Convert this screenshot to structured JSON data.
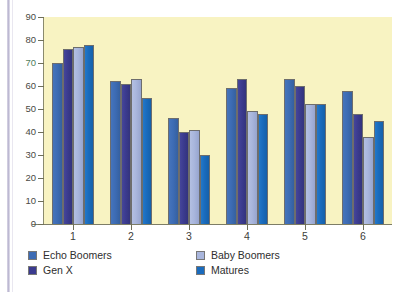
{
  "chart_data": {
    "type": "bar",
    "title": "",
    "subtitle": "",
    "xlabel": "",
    "ylabel": "",
    "categories": [
      "1",
      "2",
      "3",
      "4",
      "5",
      "6"
    ],
    "series": [
      {
        "name": "Echo Boomers",
        "color": "#3d6cb5",
        "values": [
          70,
          62,
          46,
          59,
          63,
          58
        ]
      },
      {
        "name": "Gen X",
        "color": "#3b3b8f",
        "values": [
          76,
          61,
          40,
          63,
          60,
          48
        ]
      },
      {
        "name": "Baby Boomers",
        "color": "#a9b6dd",
        "values": [
          77,
          63,
          41,
          49,
          52,
          38
        ]
      },
      {
        "name": "Matures",
        "color": "#1a6bbd",
        "values": [
          78,
          55,
          30,
          48,
          52,
          45
        ]
      }
    ],
    "ylim": [
      0,
      90
    ],
    "ytick_step": 10,
    "yticks": [
      0,
      10,
      20,
      30,
      40,
      50,
      60,
      70,
      80,
      90
    ],
    "ytick_labels": [
      "0",
      "10",
      "20",
      "30",
      "40",
      "50",
      "60",
      "70",
      "80",
      "90"
    ],
    "grid": false,
    "legend_position": "bottom",
    "plot_background": "#f8f3c2",
    "figure_background": "#ffffff",
    "axis_color": "#7d7d66",
    "tick_label_color": "#4a4a44"
  },
  "legend": {
    "items": [
      {
        "label": "Echo Boomers",
        "swatch": "s0"
      },
      {
        "label": "Gen X",
        "swatch": "s1"
      },
      {
        "label": "Baby Boomers",
        "swatch": "s2"
      },
      {
        "label": "Matures",
        "swatch": "s3"
      }
    ]
  }
}
